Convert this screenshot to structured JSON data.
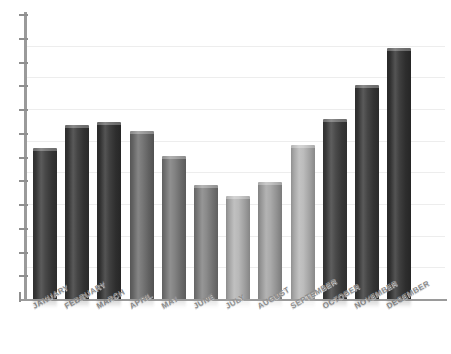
{
  "chart_data": {
    "type": "bar",
    "title": "",
    "subtitle": "",
    "xlabel": "",
    "ylabel": "",
    "categories": [
      "JANUARY",
      "FEBRUARY",
      "MARCH",
      "APRIL",
      "MAY",
      "JUNE",
      "JULY",
      "AUGUST",
      "SEPTEMBER",
      "OCTOBER",
      "NOVEMBER",
      "DECEMBER"
    ],
    "values": [
      53,
      61,
      62,
      59,
      50,
      40,
      36,
      41,
      54,
      63,
      75,
      88
    ],
    "ylim": [
      0,
      100
    ],
    "grid": true,
    "legend": null,
    "legend_position": "none",
    "y_tick_count": 13,
    "gridline_count": 8,
    "bar_colors": [
      "#3c3c3c",
      "#393939",
      "#343434",
      "#6e6e6e",
      "#7b7b7b",
      "#828282",
      "#b4b4b4",
      "#a5a5a5",
      "#b8b8b8",
      "#3f3f3f",
      "#3a3a3a",
      "#333333"
    ]
  },
  "axes": {
    "axis_color": "#9a9a9a",
    "grid_color": "#ededed",
    "label_color": "#8c8c8c"
  }
}
